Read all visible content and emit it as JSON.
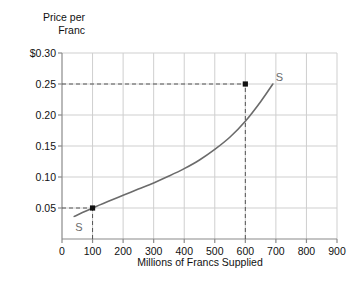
{
  "chart_data": {
    "type": "line",
    "title": "",
    "ylabel_line1": "Price per",
    "ylabel_line2": "Franc",
    "xlabel": "Millions of Francs Supplied",
    "xtick_labels": [
      "0",
      "100",
      "200",
      "300",
      "400",
      "500",
      "600",
      "700",
      "800",
      "900"
    ],
    "xticks": [
      0,
      100,
      200,
      300,
      400,
      500,
      600,
      700,
      800,
      900
    ],
    "ytick_labels": [
      "0.05",
      "0.10",
      "0.15",
      "0.20",
      "0.25",
      "$0.30"
    ],
    "yticks": [
      0.05,
      0.1,
      0.15,
      0.2,
      0.25,
      0.3
    ],
    "xlim": [
      0,
      900
    ],
    "ylim": [
      0,
      0.3
    ],
    "grid": true,
    "legend": "none",
    "series": [
      {
        "name": "S",
        "label_start": "S",
        "label_end": "S",
        "color": "#6b6b6b",
        "x": [
          40,
          100,
          150,
          200,
          250,
          300,
          350,
          400,
          450,
          500,
          550,
          600,
          650,
          690
        ],
        "y": [
          0.0365,
          0.05,
          0.0605,
          0.0705,
          0.0805,
          0.0905,
          0.1015,
          0.1135,
          0.1275,
          0.1445,
          0.1645,
          0.19,
          0.2215,
          0.25
        ]
      }
    ],
    "markers": [
      {
        "name": "lower-equilibrium-point",
        "x": 100,
        "y": 0.05
      },
      {
        "name": "upper-equilibrium-point",
        "x": 600,
        "y": 0.25
      }
    ],
    "guide_lines": [
      {
        "name": "guide-0.05-horizontal",
        "from_x": 0,
        "to_x": 100,
        "y": 0.05,
        "style": "dashed"
      },
      {
        "name": "guide-100-vertical",
        "x": 100,
        "from_y": 0,
        "to_y": 0.05,
        "style": "dashed"
      },
      {
        "name": "guide-0.25-horizontal",
        "from_x": 0,
        "to_x": 600,
        "y": 0.25,
        "style": "dashed"
      },
      {
        "name": "guide-600-vertical",
        "x": 600,
        "from_y": 0,
        "to_y": 0.25,
        "style": "dashed"
      }
    ],
    "colors": {
      "curve": "#6b6b6b",
      "grid": "#cfcfcf",
      "axis": "#8a8a8a",
      "marker": "#111111",
      "guide": "#555555",
      "background": "#ffffff"
    }
  },
  "plot_geometry": {
    "left": 62,
    "top": 53,
    "right": 337,
    "bottom": 239
  }
}
